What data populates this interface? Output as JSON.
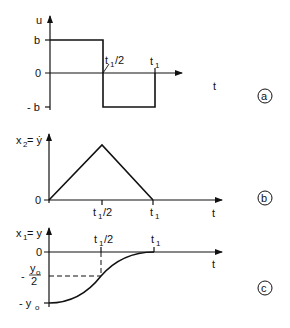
{
  "figure": {
    "panels": [
      {
        "id": "a",
        "circle_label": "a",
        "y_label": "u",
        "x_label": "t",
        "y_ticks": [
          "b",
          "0",
          "- b"
        ],
        "x_ticks": [
          "t1/2",
          "t1"
        ],
        "description": "Bang-bang control: u = b for 0 < t < t1/2, u = -b for t1/2 < t < t1"
      },
      {
        "id": "b",
        "circle_label": "b",
        "y_label": "x2 = ẏ",
        "x_label": "t",
        "y_ticks": [
          "0"
        ],
        "x_ticks": [
          "t1/2",
          "t1"
        ],
        "description": "Velocity rises linearly to peak at t1/2 then falls linearly to 0 at t1"
      },
      {
        "id": "c",
        "circle_label": "c",
        "y_label": "x1 = y",
        "x_label": "t",
        "y_ticks": [
          "0",
          "- y0/2",
          "- y0"
        ],
        "x_ticks": [
          "t1/2",
          "t1"
        ],
        "description": "Position moves from -y0 to 0 along a parabolic S-curve, passing -y0/2 at t1/2"
      }
    ]
  },
  "labels": {
    "a_y": "u",
    "a_b": "b",
    "a_zero": "0",
    "a_negb": "- b",
    "a_t1half_t": "t",
    "a_t1half_sub": "1",
    "a_t1half_rest": "/2",
    "a_t1_t": "t",
    "a_t1_sub": "1",
    "a_t": "t",
    "a_circle": "a",
    "b_y_x": "x",
    "b_y_sub": "2",
    "b_y_rest": " = ẏ",
    "b_zero": "0",
    "b_t1half_t": "t",
    "b_t1half_sub": "1",
    "b_t1half_rest": "/2",
    "b_t1_t": "t",
    "b_t1_sub": "1",
    "b_t": "t",
    "b_circle": "b",
    "c_y_x": "x",
    "c_y_sub": "1",
    "c_y_rest": " = y",
    "c_zero": "0",
    "c_half_minus": "-",
    "c_half_num_y": "y",
    "c_half_num_sub": "o",
    "c_half_den": "2",
    "c_neg_minus": "- y",
    "c_neg_sub": "o",
    "c_t1half_t": "t",
    "c_t1half_sub": "1",
    "c_t1half_rest": "/2",
    "c_t1_t": "t",
    "c_t1_sub": "1",
    "c_t": "t",
    "c_circle": "c"
  }
}
